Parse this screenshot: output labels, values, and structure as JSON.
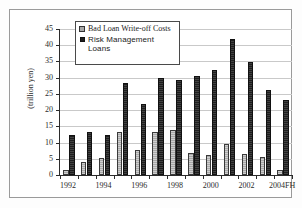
{
  "chart_data": {
    "type": "bar",
    "title": "",
    "xlabel": "",
    "ylabel": "(trillion yen)",
    "ylim": [
      0,
      45
    ],
    "yticks": [
      0,
      5,
      10,
      15,
      20,
      25,
      30,
      35,
      40,
      45
    ],
    "grid": true,
    "legend_position": "top-left-inside",
    "categories": [
      "1992",
      "1993",
      "1994",
      "1995",
      "1996",
      "1997",
      "1998",
      "1999",
      "2000",
      "2001",
      "2002",
      "2003",
      "2004FH"
    ],
    "tick_labels": [
      "1992",
      "",
      "1994",
      "",
      "1996",
      "",
      "1998",
      "",
      "2000",
      "",
      "2002",
      "",
      "2004FH"
    ],
    "series": [
      {
        "name": "Bad Loan Write-off Costs",
        "color": "#a8a8a8",
        "values": [
          1.6,
          3.9,
          5.3,
          13.4,
          7.8,
          13.3,
          13.8,
          6.9,
          6.1,
          9.7,
          6.6,
          5.4,
          1.6
        ]
      },
      {
        "name": "Risk Management Loans",
        "color": "#1e1e1e",
        "values": [
          12.4,
          13.4,
          12.2,
          28.5,
          21.8,
          29.8,
          29.4,
          30.4,
          32.5,
          41.8,
          34.9,
          26.2,
          23.2
        ]
      }
    ]
  },
  "legend": {
    "items": [
      {
        "label": "Bad Loan Write-off Costs",
        "swatch": "light"
      },
      {
        "label": "Risk Management Loans",
        "swatch": "dark"
      }
    ]
  }
}
